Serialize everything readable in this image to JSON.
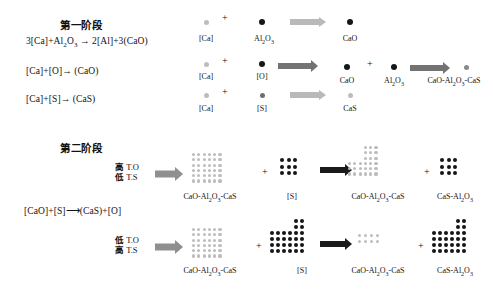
{
  "figure": {
    "type": "diagram",
    "title_stage1": "第一阶段",
    "title_stage2": "第二阶段",
    "colors": {
      "light_gray": "#bdbdbd",
      "mid_gray": "#8a8a8a",
      "dark_gray": "#6e6e6e",
      "black": "#161616",
      "arrow_light": "#b9b9b9",
      "arrow_mid": "#737373",
      "arrow_dark": "#8f8f8f",
      "arrow_black": "#1a1a1a",
      "text": "#111111"
    }
  },
  "stage1": {
    "title": "第一阶段",
    "equations": [
      "3[Ca]+Al₂O₃ ⟶ 2[Al]+3(CaO)",
      "[Ca]+[O]⟶ (CaO)",
      "[Ca]+[S]⟶ (CaS)"
    ],
    "eq1": {
      "lhs_a": "3[Ca]+Al",
      "sub1": "2",
      "mid": "O",
      "sub2": "3",
      "arrow": "→",
      "rhs": "2[Al]+3(CaO)"
    },
    "eq2": {
      "text": "[Ca]+[O]→ (CaO)"
    },
    "eq3": {
      "text": "[Ca]+[S]→ (CaS)"
    },
    "rows": [
      {
        "name": "row-cao-from-alumina",
        "items": [
          {
            "kind": "particle",
            "label": "[Ca]",
            "color": "light_gray",
            "size": 5
          },
          {
            "kind": "plus",
            "label": "+"
          },
          {
            "kind": "particle",
            "label": "Al₂O₃",
            "label_parts": [
              "Al",
              "2",
              "O",
              "3"
            ],
            "color": "black",
            "size": 6
          },
          {
            "kind": "arrow",
            "style": "light"
          },
          {
            "kind": "particle",
            "label": "CaO",
            "color": "black",
            "size": 6
          }
        ]
      },
      {
        "name": "row-cao-plus-alumina",
        "items": [
          {
            "kind": "particle",
            "label": "[Ca]",
            "color": "light_gray",
            "size": 5
          },
          {
            "kind": "plus",
            "label": "+"
          },
          {
            "kind": "particle",
            "label": "[O]",
            "color": "black",
            "size": 6
          },
          {
            "kind": "arrow",
            "style": "dark"
          },
          {
            "kind": "particle",
            "label": "CaO",
            "color": "black",
            "size": 6
          },
          {
            "kind": "plus",
            "label": "+"
          },
          {
            "kind": "particle",
            "label": "Al₂O₃",
            "label_parts": [
              "Al",
              "2",
              "O",
              "3"
            ],
            "color": "black",
            "size": 6
          },
          {
            "kind": "arrow",
            "style": "dark"
          },
          {
            "kind": "particle",
            "label": "CaO-Al₂O₃-CaS",
            "color": "mid_gray",
            "size": 5
          }
        ]
      },
      {
        "name": "row-cas",
        "items": [
          {
            "kind": "particle",
            "label": "[Ca]",
            "color": "light_gray",
            "size": 5
          },
          {
            "kind": "plus",
            "label": "+"
          },
          {
            "kind": "particle",
            "label": "[S]",
            "color": "dark_gray",
            "size": 5
          },
          {
            "kind": "arrow",
            "style": "light"
          },
          {
            "kind": "particle",
            "label": "CaS",
            "color": "light_gray",
            "size": 5
          }
        ]
      }
    ]
  },
  "stage2": {
    "title": "第二阶段",
    "equation": "[CaO]+[S]⟶(CaS)+[O]",
    "rows": [
      {
        "name": "row-high-to-low-ts",
        "condition": {
          "line1_cn": "高",
          "line1_en": "T.O",
          "line2_cn": "低",
          "line2_en": "T.S"
        },
        "reactant": {
          "label": "CaO-Al₂O₃-CaS",
          "shape": "grid",
          "cols": 6,
          "rows": 6,
          "color": "light_gray",
          "dot": 3.2,
          "gap": 2.1
        },
        "plus1": "+",
        "sulfur": {
          "label": "[S]",
          "shape": "grid",
          "cols": 3,
          "rows": 3,
          "color": "black",
          "dot": 4.2,
          "gap": 2.4
        },
        "arrow": {
          "style": "black"
        },
        "product": {
          "label": "CaO-Al₂O₃-CaS",
          "shape": "L",
          "color": "light_gray",
          "dot": 3.2,
          "gap": 2.1,
          "top_cols": 3,
          "top_rows": 3,
          "bottom_cols": 6,
          "bottom_rows": 3
        },
        "plus2": "+",
        "byproduct": {
          "label": "CaS-Al₂O₃",
          "shape": "grid",
          "cols": 3,
          "rows": 3,
          "color": "black",
          "dot": 4.2,
          "gap": 2.4
        }
      },
      {
        "name": "row-low-to-high-ts",
        "condition": {
          "line1_cn": "低",
          "line1_en": "T.O",
          "line2_cn": "高",
          "line2_en": "T.S"
        },
        "reactant": {
          "label": "CaO-Al₂O₃-CaS",
          "shape": "grid",
          "cols": 6,
          "rows": 6,
          "color": "light_gray",
          "dot": 3.2,
          "gap": 2.1
        },
        "plus1": "+",
        "sulfur": {
          "label": "[S]",
          "shape": "L",
          "color": "black",
          "dot": 4.0,
          "gap": 2.0,
          "top_cols": 2,
          "top_rows": 2,
          "bottom_cols": 6,
          "bottom_rows": 4
        },
        "arrow": {
          "style": "black"
        },
        "product": {
          "label": "CaO-Al₂O₃-CaS",
          "shape": "grid",
          "cols": 4,
          "rows": 2,
          "color": "light_gray",
          "dot": 3.4,
          "gap": 2.6
        },
        "plus2": "+",
        "byproduct": {
          "label": "CaS-Al₂O₃",
          "shape": "L",
          "color": "black",
          "dot": 4.0,
          "gap": 2.0,
          "top_cols": 2,
          "top_rows": 2,
          "bottom_cols": 6,
          "bottom_rows": 4
        }
      }
    ]
  },
  "labels": {
    "ca": "[Ca]",
    "o": "[O]",
    "s": "[S]",
    "cao": "CaO",
    "cas": "CaS",
    "alumina": "Al",
    "alumina_sub1": "2",
    "alumina_mid": "O",
    "alumina_sub2": "3",
    "complex": "CaO-Al",
    "complex_sub1": "2",
    "complex_mid": "O",
    "complex_sub2": "3",
    "complex_tail": "-CaS",
    "cas_alumina_head": "CaS-Al",
    "cas_alumina_sub1": "2",
    "cas_alumina_mid": "O",
    "cas_alumina_sub2": "3",
    "plus": "+"
  }
}
